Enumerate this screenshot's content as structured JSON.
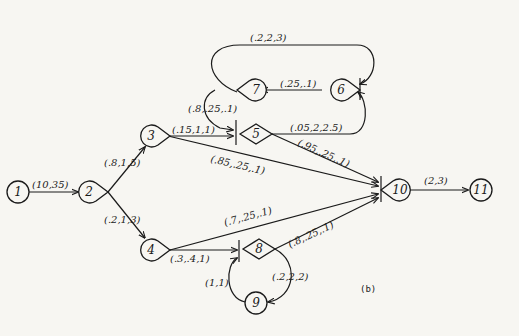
{
  "diagram": {
    "caption": "(b)",
    "nodes": [
      {
        "id": "1",
        "label": "1",
        "shape": "circle"
      },
      {
        "id": "2",
        "label": "2",
        "shape": "teardrop"
      },
      {
        "id": "3",
        "label": "3",
        "shape": "teardrop"
      },
      {
        "id": "4",
        "label": "4",
        "shape": "teardrop"
      },
      {
        "id": "5",
        "label": "5",
        "shape": "diamond"
      },
      {
        "id": "6",
        "label": "6",
        "shape": "teardrop"
      },
      {
        "id": "7",
        "label": "7",
        "shape": "teardrop"
      },
      {
        "id": "8",
        "label": "8",
        "shape": "diamond"
      },
      {
        "id": "9",
        "label": "9",
        "shape": "circle"
      },
      {
        "id": "10",
        "label": "10",
        "shape": "teardrop"
      },
      {
        "id": "11",
        "label": "11",
        "shape": "circle"
      }
    ],
    "edges": [
      {
        "from": "1",
        "to": "2",
        "label": "(10,35)"
      },
      {
        "from": "2",
        "to": "3",
        "label": "(.8,1,5)"
      },
      {
        "from": "2",
        "to": "4",
        "label": "(.2,1,3)"
      },
      {
        "from": "3",
        "to": "5",
        "label": "(.15,1,1)"
      },
      {
        "from": "3",
        "to": "10",
        "label": "(.85,.25,.1)"
      },
      {
        "from": "7",
        "to": "5",
        "label": "(.8,.25,.1)"
      },
      {
        "from": "5",
        "to": "6",
        "label": "(.05,2,2.5)"
      },
      {
        "from": "5",
        "to": "10",
        "label": "(.95,.25,.1)"
      },
      {
        "from": "6",
        "to": "7",
        "label": "(.25,.1)"
      },
      {
        "from": "7",
        "to": "6",
        "label": "(.2,2,3)"
      },
      {
        "from": "4",
        "to": "8",
        "label": "(.3,.4,1)"
      },
      {
        "from": "4",
        "to": "10",
        "label": "(.7,.25,.1)"
      },
      {
        "from": "8",
        "to": "10",
        "label": "(.8,.25,.1)"
      },
      {
        "from": "8",
        "to": "9",
        "label": "(.2,2,2)"
      },
      {
        "from": "9",
        "to": "8",
        "label": "(1,1)"
      },
      {
        "from": "10",
        "to": "11",
        "label": "(2,3)"
      }
    ]
  }
}
